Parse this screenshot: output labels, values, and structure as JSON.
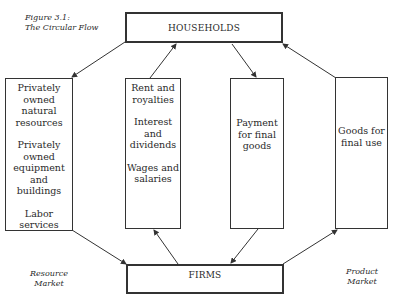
{
  "figure": {
    "number": "Figure 3.1:",
    "title": "The Circular Flow"
  },
  "nodes": {
    "households": "HOUSEHOLDS",
    "firms": "FIRMS"
  },
  "boxes": {
    "resources": [
      "Privately owned natural resources",
      "Privately owned equipment and buildings",
      "Labor services"
    ],
    "income": [
      "Rent and royalties",
      "Interest and dividends",
      "Wages and salaries"
    ],
    "payment": [
      "Payment for final goods"
    ],
    "goods": [
      "Goods for final use"
    ]
  },
  "markets": {
    "resource": [
      "Resource",
      "Market"
    ],
    "product": [
      "Product",
      "Market"
    ]
  },
  "colors": {
    "line": "#333333",
    "text": "#2a2a2a"
  }
}
